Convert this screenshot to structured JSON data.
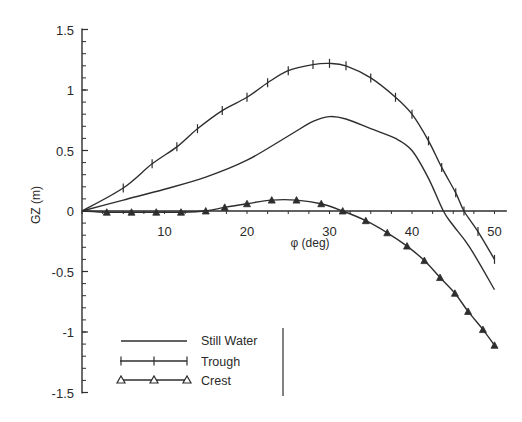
{
  "chart_data": {
    "type": "line",
    "title": "",
    "xlabel": "φ (deg)",
    "ylabel": "GZ (m)",
    "xlim": [
      0,
      50
    ],
    "ylim": [
      -1.5,
      1.5
    ],
    "xticks": [
      10,
      20,
      30,
      40,
      50
    ],
    "xtick_labels": [
      "10",
      "20",
      "30",
      "40",
      "50"
    ],
    "yticks": [
      1.5,
      1,
      0.5,
      0,
      -0.5,
      -1,
      -1.5
    ],
    "ytick_labels": [
      "1.5",
      "1",
      "0.5",
      "0",
      "-0.5",
      "-1",
      "-1.5"
    ],
    "grid": false,
    "legend_position": "lower left",
    "series": [
      {
        "name": "Still Water",
        "marker": "none",
        "x": [
          0,
          5,
          10,
          15,
          20,
          25,
          28,
          30,
          32,
          35,
          38,
          40,
          42,
          43.8,
          45,
          47,
          50
        ],
        "values": [
          0,
          0.09,
          0.18,
          0.28,
          0.42,
          0.62,
          0.74,
          0.78,
          0.76,
          0.68,
          0.6,
          0.5,
          0.27,
          0,
          -0.12,
          -0.3,
          -0.65
        ]
      },
      {
        "name": "Trough",
        "marker": "plus",
        "x": [
          0,
          5,
          8.5,
          11.5,
          14,
          17,
          20,
          22.5,
          25,
          28,
          30,
          32,
          35,
          38,
          40,
          42,
          43.6,
          45.3,
          46.3,
          48,
          50
        ],
        "values": [
          0,
          0.19,
          0.39,
          0.53,
          0.68,
          0.83,
          0.94,
          1.06,
          1.16,
          1.21,
          1.22,
          1.2,
          1.1,
          0.94,
          0.8,
          0.58,
          0.36,
          0.15,
          0,
          -0.17,
          -0.4
        ]
      },
      {
        "name": "Crest",
        "marker": "triangle",
        "x": [
          0,
          3,
          6,
          9,
          12,
          15,
          17.3,
          20,
          23,
          26,
          29,
          31.6,
          34.4,
          37,
          39.4,
          41.5,
          43.4,
          45.2,
          46.8,
          48.6,
          50
        ],
        "values": [
          0,
          -0.01,
          -0.01,
          -0.01,
          -0.01,
          0,
          0.03,
          0.06,
          0.09,
          0.09,
          0.06,
          0,
          -0.08,
          -0.18,
          -0.29,
          -0.41,
          -0.55,
          -0.68,
          -0.83,
          -0.98,
          -1.11
        ]
      }
    ]
  },
  "legend": {
    "items": [
      {
        "label": "Still Water"
      },
      {
        "label": "Trough"
      },
      {
        "label": "Crest"
      }
    ]
  },
  "colors": {
    "line": "#2e2e2e",
    "axis": "#2e2e2e",
    "text": "#2a2a2a",
    "background": "#ffffff"
  }
}
